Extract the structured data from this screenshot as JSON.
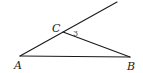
{
  "diagram": {
    "type": "geometry",
    "points": {
      "A": {
        "label": "A",
        "x": 20,
        "y": 56,
        "label_x": 14,
        "label_y": 69
      },
      "B": {
        "label": "B",
        "x": 130,
        "y": 57,
        "label_x": 127,
        "label_y": 70
      },
      "C": {
        "label": "C",
        "x": 63,
        "y": 32,
        "label_x": 52,
        "label_y": 32
      },
      "E": {
        "x": 117,
        "y": 2
      }
    },
    "segments": [
      {
        "from": "A",
        "to": "E",
        "note": "ray from A through C extended"
      },
      {
        "from": "A",
        "to": "B"
      },
      {
        "from": "C",
        "to": "B"
      }
    ],
    "angle_labels": [
      {
        "text": "3",
        "x": 73,
        "y": 35,
        "vertex": "C"
      }
    ],
    "stroke_color": "#1a1a1a"
  }
}
